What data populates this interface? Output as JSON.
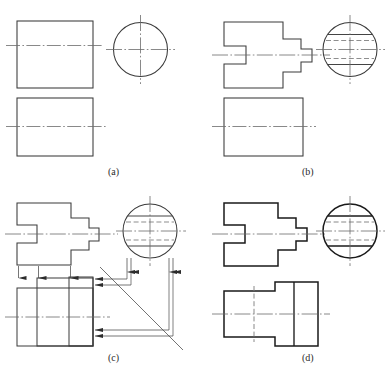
{
  "figure": {
    "width": 389,
    "height": 374,
    "background_color": "#ffffff",
    "line_color": "#3a3a3a",
    "heavy_line_color": "#1a1a1a",
    "center_line_color": "#6b6b6b",
    "hidden_line_color": "#7a7a7a",
    "panels": [
      {
        "id": "a",
        "label": "(a)",
        "caption_x": 108,
        "caption_y": 166
      },
      {
        "id": "b",
        "label": "(b)",
        "caption_x": 302,
        "caption_y": 166
      },
      {
        "id": "c",
        "label": "(c)",
        "caption_x": 108,
        "caption_y": 352
      },
      {
        "id": "d",
        "label": "(d)",
        "caption_x": 302,
        "caption_y": 352
      }
    ],
    "geometry_notes": {
      "panel_a": "Plain rectangle front view, plain circle side view, plain rectangle top view; centerlines only.",
      "panel_b": "Stepped cross-shaped front view, circle side view with two solid and two hidden lines, plain rectangle top view.",
      "panel_c": "Stepped cross front view, circle side view with hidden lines, construction projection lines with arrowheads and 45-degree miter line.",
      "panel_d": "Completed three views: stepped cross front view, circle side view with solid and hidden lines, finished top view with hidden line and visible step edges."
    },
    "line_types": {
      "visible": "solid",
      "hidden": "dashed",
      "center": "dash-dot",
      "construction": "thin solid with arrowheads",
      "miter": "45 degree thin solid"
    },
    "stroke_widths": {
      "thin": 0.7,
      "normal": 0.9,
      "heavy": 1.6,
      "center": 0.7
    }
  }
}
